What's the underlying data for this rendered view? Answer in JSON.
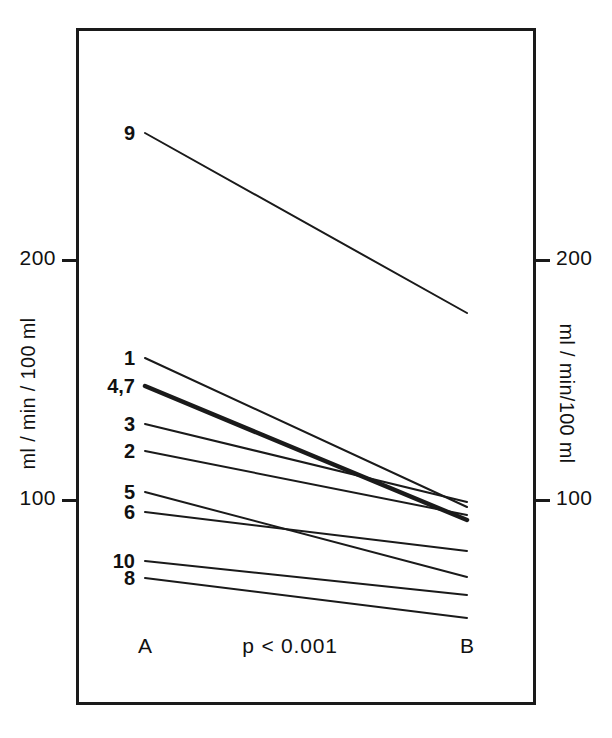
{
  "figure": {
    "background_color": "#ffffff",
    "ink_color": "#1a1a1a",
    "frame": {
      "x": 76,
      "y": 28,
      "width": 460,
      "height": 677
    }
  },
  "axes": {
    "left": {
      "title": "ml / min / 100 ml",
      "ticks": [
        {
          "label": "200",
          "value": 200,
          "y": 260
        },
        {
          "label": "100",
          "value": 100,
          "y": 500
        }
      ]
    },
    "right": {
      "title": "ml / min/100 ml",
      "ticks": [
        {
          "label": "200",
          "value": 200,
          "y": 260
        },
        {
          "label": "100",
          "value": 100,
          "y": 500
        }
      ]
    }
  },
  "footer": {
    "group_a": "A",
    "group_b": "B",
    "pvalue": "p < 0.001"
  },
  "chart_data": {
    "type": "line",
    "title": "",
    "subtitle": "",
    "xlabel": "",
    "ylabel": "ml / min / 100 ml",
    "categories": [
      "A",
      "B"
    ],
    "ylim": [
      36,
      297
    ],
    "grid": false,
    "legend": "none",
    "annotations": [
      "p < 0.001"
    ],
    "note": "Paired before-after plot; each line is one subject labelled at its A-side endpoint.",
    "series": [
      {
        "name": "9",
        "label": "9",
        "values": [
          253,
          178
        ],
        "x_px": [
          145,
          467
        ],
        "y_px": [
          133,
          313
        ],
        "emphasis": false
      },
      {
        "name": "1",
        "label": "1",
        "values": [
          159,
          97
        ],
        "x_px": [
          145,
          467
        ],
        "y_px": [
          358,
          507
        ],
        "emphasis": false
      },
      {
        "name": "4,7",
        "label": "4,7",
        "values": [
          147,
          92
        ],
        "x_px": [
          145,
          467
        ],
        "y_px": [
          386,
          520
        ],
        "emphasis": true
      },
      {
        "name": "3",
        "label": "3",
        "values": [
          132,
          99
        ],
        "x_px": [
          145,
          467
        ],
        "y_px": [
          424,
          502
        ],
        "emphasis": false
      },
      {
        "name": "2",
        "label": "2",
        "values": [
          120,
          94
        ],
        "x_px": [
          145,
          467
        ],
        "y_px": [
          451,
          515
        ],
        "emphasis": false
      },
      {
        "name": "5",
        "label": "5",
        "values": [
          103,
          68
        ],
        "x_px": [
          145,
          467
        ],
        "y_px": [
          492,
          577
        ],
        "emphasis": false
      },
      {
        "name": "6",
        "label": "6",
        "values": [
          95,
          79
        ],
        "x_px": [
          145,
          467
        ],
        "y_px": [
          512,
          551
        ],
        "emphasis": false
      },
      {
        "name": "10",
        "label": "10",
        "values": [
          74,
          60
        ],
        "x_px": [
          145,
          467
        ],
        "y_px": [
          561,
          595
        ],
        "emphasis": false
      },
      {
        "name": "8",
        "label": "8",
        "values": [
          67,
          56
        ],
        "x_px": [
          145,
          467
        ],
        "y_px": [
          578,
          618
        ],
        "emphasis": false
      }
    ]
  }
}
